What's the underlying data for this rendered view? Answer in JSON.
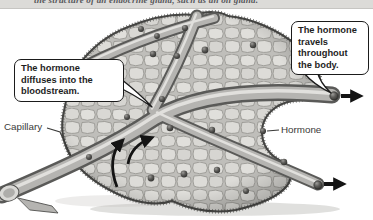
{
  "figure": {
    "caption_fragment": "the structure of an endocrine gland, such as an oil gland.",
    "callout_diffuse": "The hormone diffuses into the bloodstream.",
    "callout_travel": "The hormone travels throughout the body.",
    "label_capillary": "Capillary",
    "label_hormone": "Hormone",
    "icons": {
      "exit_arrow_top": "right-arrow",
      "exit_arrow_bottom": "right-arrow",
      "diffusion_arrow_left": "curved-up-arrow",
      "diffusion_arrow_right": "curved-up-arrow"
    },
    "colors": {
      "caption_band": "#dcdbd8",
      "background": "#ffffff",
      "tissue_cell": "#d9d8d4",
      "tissue_base": "#bfbeba",
      "tissue_outline": "#454543",
      "vessel_body": "#b5b4b1",
      "vessel_outline": "#5a5a58",
      "vessel_highlight": "#e9e8e5",
      "hormone_dot": "#333331",
      "arrow": "#141414",
      "callout_border": "#1b1b1b",
      "callout_background": "#ffffff",
      "label_text": "#3a3a38"
    }
  }
}
